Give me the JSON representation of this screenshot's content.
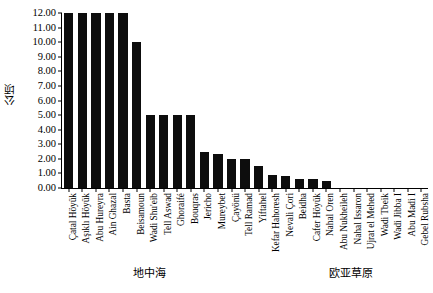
{
  "chart_data": {
    "type": "bar",
    "title": "",
    "subtitle": "",
    "xlabel": "",
    "ylabel": "公顷",
    "ylim": [
      0,
      12
    ],
    "ytick_step": 1,
    "ytick_format": "0.00",
    "yticks": [
      "12.00",
      "11.00",
      "10.00",
      "9.00",
      "8.00",
      "7.00",
      "6.00",
      "5.00",
      "4.00",
      "3.00",
      "2.00",
      "1.00",
      "0.00"
    ],
    "grid": false,
    "legend": null,
    "bar_color": "#0d0d0d",
    "axis_color": "#000000",
    "categories": [
      "Çatal Höyük",
      "Aşıklı Höyük",
      "Abu Hureyra",
      "Ain Ghazal",
      "Basta",
      "Beisamoun",
      "Wadi Shu'eib",
      "Tell Aswad",
      "Ghoraifé",
      "Bouqras",
      "Jericho",
      "Mureybet",
      "Çayönü",
      "Tell Ramad",
      "Yiftahel",
      "Kefar Hahoresh",
      "Nevali Çori",
      "Beidha",
      "Cafer Höyük",
      "Nahal Oren",
      "Abu Nukheileh",
      "Nahal Issaron",
      "Ujrat el Mehed",
      "Wadi Tbeik",
      "Wadi Jibba I",
      "Abu Madi I",
      "Gebel Rubsha"
    ],
    "values": [
      12.0,
      12.0,
      12.0,
      12.0,
      12.0,
      10.0,
      5.0,
      5.0,
      5.0,
      5.0,
      2.5,
      2.3,
      2.0,
      2.0,
      1.5,
      0.9,
      0.8,
      0.6,
      0.6,
      0.5,
      0.0,
      0.0,
      0.0,
      0.0,
      0.0,
      0.0,
      0.0
    ],
    "groups": [
      {
        "label": "地中海",
        "start_index": 0,
        "end_index": 19
      },
      {
        "label": "欧亚草原",
        "start_index": 20,
        "end_index": 26
      }
    ]
  }
}
